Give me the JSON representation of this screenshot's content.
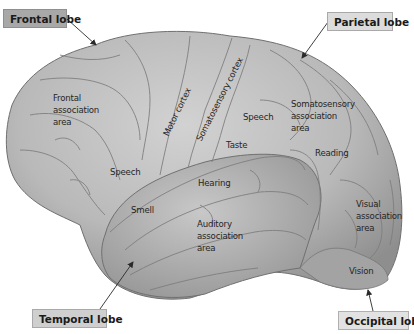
{
  "diagram": {
    "lobes": [
      {
        "id": "frontal",
        "label": "Frontal lobe"
      },
      {
        "id": "parietal",
        "label": "Parietal lobe"
      },
      {
        "id": "temporal",
        "label": "Temporal lobe"
      },
      {
        "id": "occipital",
        "label": "Occipital lobe"
      }
    ],
    "areas": {
      "frontal_assoc": [
        "Frontal",
        "association",
        "area"
      ],
      "speech_frontal": "Speech",
      "motor_cortex": "Motor cortex",
      "somatosensory_cortex": "Somatosensory cortex",
      "speech_parietal": "Speech",
      "taste": "Taste",
      "somatosensory_assoc": [
        "Somatosensory",
        "association",
        "area"
      ],
      "reading": "Reading",
      "hearing": "Hearing",
      "smell": "Smell",
      "auditory_assoc": [
        "Auditory",
        "association",
        "area"
      ],
      "visual_assoc": [
        "Visual",
        "association",
        "area"
      ],
      "vision": "Vision"
    },
    "colors": {
      "brain_fill": "#bdbdbd",
      "brain_shadow": "#8a8a8a",
      "sulcus": "#7d7d7d",
      "arrow": "#2a2a2a"
    }
  }
}
